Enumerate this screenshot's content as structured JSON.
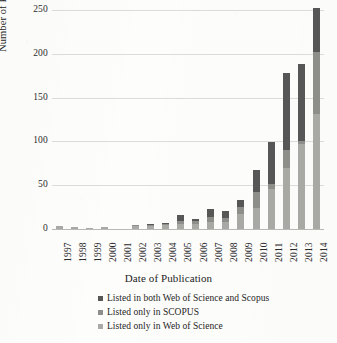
{
  "chart_data": {
    "type": "bar",
    "stacked": true,
    "title": "",
    "xlabel": "Date of Publication",
    "ylabel": "Number of Publications",
    "categories": [
      "1997",
      "1998",
      "1999",
      "2000",
      "2001",
      "2002",
      "2003",
      "2004",
      "2005",
      "2006",
      "2007",
      "2008",
      "2009",
      "2010",
      "2011",
      "2012",
      "2013",
      "2014"
    ],
    "ylim": [
      0,
      250
    ],
    "yticks": [
      0,
      50,
      100,
      150,
      200,
      250
    ],
    "grid": true,
    "legend_position": "bottom-center",
    "series": [
      {
        "name": "Listed only in Web of Science",
        "color": "#a9a9a6",
        "values": [
          4,
          2,
          1,
          2,
          0,
          4,
          4,
          5,
          6,
          6,
          8,
          8,
          17,
          24,
          46,
          70,
          97,
          131
        ]
      },
      {
        "name": "Listed only in SCOPUS",
        "color": "#8e8e8b",
        "values": [
          0,
          0,
          0,
          0,
          0,
          1,
          1,
          1,
          3,
          3,
          6,
          5,
          8,
          18,
          5,
          20,
          3,
          71
        ]
      },
      {
        "name": "Listed in both Web of Science and Scopus",
        "color": "#575757",
        "values": [
          0,
          0,
          0,
          0,
          0,
          0,
          1,
          1,
          7,
          3,
          9,
          8,
          8,
          25,
          48,
          88,
          88,
          50
        ]
      }
    ],
    "totals": [
      4,
      2,
      1,
      2,
      0,
      5,
      6,
      7,
      16,
      12,
      23,
      21,
      33,
      67,
      99,
      178,
      188,
      252
    ]
  },
  "legend": {
    "items": [
      {
        "label": "Listed in both Web of Science and Scopus",
        "color": "#575757"
      },
      {
        "label": "Listed only in SCOPUS",
        "color": "#8e8e8b"
      },
      {
        "label": "Listed only in Web of Science",
        "color": "#a9a9a6"
      }
    ]
  }
}
